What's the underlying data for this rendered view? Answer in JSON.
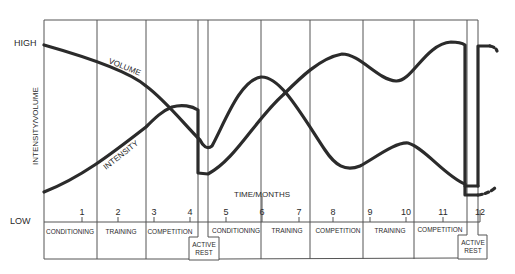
{
  "chart_data": {
    "type": "line",
    "title": "",
    "xlabel": "TIME/MONTHS",
    "ylabel": "INTENSITY/VOLUME",
    "y_levels": [
      "LOW",
      "HIGH"
    ],
    "x_ticks": [
      "1",
      "2",
      "3",
      "4",
      "5",
      "6",
      "7",
      "8",
      "9",
      "10",
      "11",
      "12"
    ],
    "series": [
      {
        "name": "VOLUME",
        "description": "starts high, declines through months 1-4, drops at active rest, rises to peak ~month 6, falls to trough ~month 8, rises ~month 10, falls to low ~month 12"
      },
      {
        "name": "INTENSITY",
        "description": "starts low, rises through months 1-4 to peak in competition, drops at active rest, rises to peak ~month 8, dips ~month 9.5, peaks ~month 11.5, drops at final active rest"
      }
    ],
    "phases": [
      {
        "label": "CONDITIONING",
        "months": "0-1.5"
      },
      {
        "label": "TRAINING",
        "months": "1.5-3"
      },
      {
        "label": "COMPETITION",
        "months": "3-4.3"
      },
      {
        "label": "ACTIVE REST",
        "months": "4.3-4.6"
      },
      {
        "label": "CONDITIONING",
        "months": "4.6-6"
      },
      {
        "label": "TRAINING",
        "months": "6-7.4"
      },
      {
        "label": "COMPETITION",
        "months": "7.4-8.9"
      },
      {
        "label": "TRAINING",
        "months": "8.9-10.3"
      },
      {
        "label": "COMPETITION",
        "months": "10.3-11.7"
      },
      {
        "label": "ACTIVE REST",
        "months": "11.7-12"
      }
    ]
  },
  "labels": {
    "high": "HIGH",
    "low": "LOW",
    "y_axis": "INTENSITY/VOLUME",
    "x_axis": "TIME/MONTHS",
    "volume": "VOLUME",
    "intensity": "INTENSITY",
    "active": "ACTIVE",
    "rest": "REST"
  },
  "ticks": [
    {
      "label": "1",
      "x": 82
    },
    {
      "label": "2",
      "x": 118
    },
    {
      "label": "3",
      "x": 154
    },
    {
      "label": "4",
      "x": 190
    },
    {
      "label": "5",
      "x": 226
    },
    {
      "label": "6",
      "x": 262
    },
    {
      "label": "7",
      "x": 299
    },
    {
      "label": "8",
      "x": 333
    },
    {
      "label": "9",
      "x": 370
    },
    {
      "label": "10",
      "x": 406
    },
    {
      "label": "11",
      "x": 443
    },
    {
      "label": "12",
      "x": 480
    }
  ],
  "phase_labels": [
    {
      "label": "CONDITIONING",
      "x": 70
    },
    {
      "label": "TRAINING",
      "x": 121
    },
    {
      "label": "COMPETITION",
      "x": 170
    },
    {
      "label": "CONDITIONING",
      "x": 236
    },
    {
      "label": "TRAINING",
      "x": 287
    },
    {
      "label": "COMPETITION",
      "x": 338
    },
    {
      "label": "TRAINING",
      "x": 390
    },
    {
      "label": "COMPETITION",
      "x": 440
    }
  ]
}
